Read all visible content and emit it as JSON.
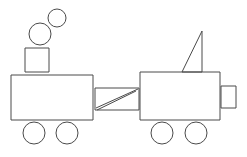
{
  "scene": {
    "title": "Train line drawing",
    "description": "Black-and-white outline drawing of a two-car train with smoke puffs, a coupling bar and a triangular flag",
    "width": 247,
    "height": 157,
    "background_color": "#ffffff",
    "stroke_color": "#4a4a4a",
    "stroke_width": 1
  },
  "objects": {
    "smoke_large": {
      "name": "smoke-puff-large",
      "shape": "circle",
      "cx": 40,
      "cy": 34,
      "r": 11
    },
    "smoke_small": {
      "name": "smoke-puff-small",
      "shape": "circle",
      "cx": 57,
      "cy": 18,
      "r": 9
    },
    "chimney_box": {
      "name": "chimney-box",
      "shape": "rect",
      "x": 25,
      "y": 48,
      "width": 24,
      "height": 24
    },
    "left_car_body": {
      "name": "left-car-body",
      "shape": "rect",
      "x": 11,
      "y": 75,
      "width": 82,
      "height": 45
    },
    "left_wheel_front": {
      "name": "left-car-wheel-front",
      "shape": "circle",
      "cx": 34,
      "cy": 133,
      "r": 11
    },
    "left_wheel_rear": {
      "name": "left-car-wheel-rear",
      "shape": "circle",
      "cx": 67,
      "cy": 133,
      "r": 11
    },
    "coupling_box": {
      "name": "coupling-box",
      "shape": "rect",
      "x": 95,
      "y": 88,
      "width": 44,
      "height": 22
    },
    "coupling_diagonal_upper": {
      "name": "coupling-diagonal-upper",
      "shape": "line",
      "x1": 96,
      "y1": 108,
      "x2": 138,
      "y2": 89
    },
    "coupling_diagonal_lower": {
      "name": "coupling-diagonal-lower",
      "shape": "line",
      "x1": 97,
      "y1": 110,
      "x2": 136,
      "y2": 91
    },
    "flag_triangle": {
      "name": "flag-triangle",
      "shape": "polygon",
      "points": "202,31 202,72 182,72"
    },
    "right_car_body": {
      "name": "right-car-body",
      "shape": "rect",
      "x": 140,
      "y": 72,
      "width": 80,
      "height": 48
    },
    "right_car_coupler_box": {
      "name": "right-car-coupler-box",
      "shape": "rect",
      "x": 221,
      "y": 86,
      "width": 15,
      "height": 22
    },
    "right_wheel_front": {
      "name": "right-car-wheel-front",
      "shape": "circle",
      "cx": 162,
      "cy": 133,
      "r": 11
    },
    "right_wheel_rear": {
      "name": "right-car-wheel-rear",
      "shape": "circle",
      "cx": 196,
      "cy": 133,
      "r": 11
    }
  }
}
